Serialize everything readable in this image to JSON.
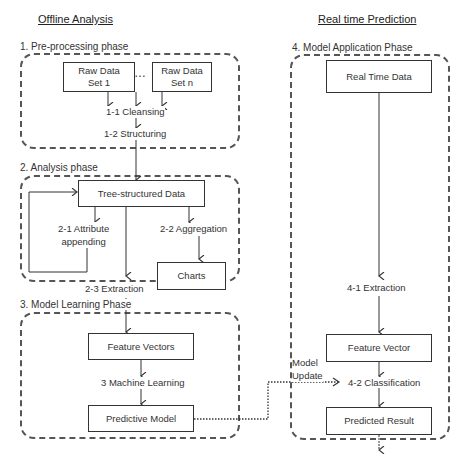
{
  "headings": {
    "offline": "Offline Analysis",
    "realtime": "Real time Prediction"
  },
  "phases": [
    {
      "label": "1. Pre-processing phase"
    },
    {
      "label": "2. Analysis phase"
    },
    {
      "label": "3. Model Learning Phase"
    },
    {
      "label": "4. Model Application Phase"
    }
  ],
  "nodes": {
    "raw1": "Raw Data Set 1",
    "raw1_l1": "Raw Data",
    "raw1_l2": "Set 1",
    "ellipsis": "…",
    "rawn_l1": "Raw Data",
    "rawn_l2": "Set n",
    "tree": "Tree-structured Data",
    "charts": "Charts",
    "feature_vectors": "Feature Vectors",
    "predictive_model": "Predictive Model",
    "real_time_data": "Real Time Data",
    "feature_vector": "Feature Vector",
    "predicted_result": "Predicted Result"
  },
  "steps": {
    "cleansing": "1-1 Cleansing",
    "structuring": "1-2 Structuring",
    "attr_l1": "2-1 Attribute",
    "attr_l2": "appending",
    "aggregation": "2-2 Aggregation",
    "extraction": "2-3 Extraction",
    "machine_learning": "3 Machine Learning",
    "extraction_rt": "4-1 Extraction",
    "classification": "4-2 Classification",
    "model_update_l1": "Model",
    "model_update_l2": "Update"
  }
}
